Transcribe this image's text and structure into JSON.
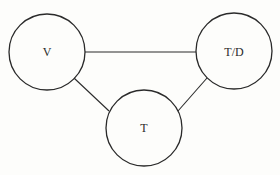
{
  "diagram": {
    "type": "graph",
    "nodes": [
      {
        "id": "V",
        "label": "V"
      },
      {
        "id": "TD",
        "label": "T/D"
      },
      {
        "id": "T",
        "label": "T"
      }
    ],
    "edges": [
      {
        "from": "V",
        "to": "TD"
      },
      {
        "from": "V",
        "to": "T"
      },
      {
        "from": "TD",
        "to": "T"
      }
    ],
    "colors": {
      "stroke": "#2a2a2a",
      "background": "#fdfdfb"
    }
  }
}
